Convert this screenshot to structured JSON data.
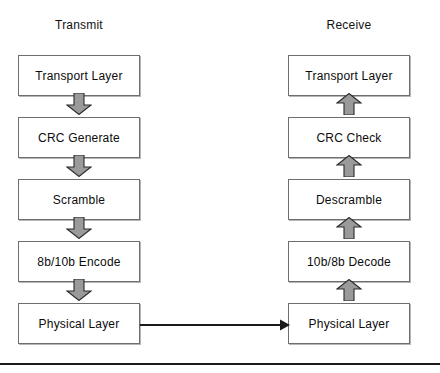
{
  "diagram": {
    "title_left": "Transmit",
    "title_right": "Receive",
    "colors": {
      "box_border": "#6e6e6e",
      "box_fill": "#ffffff",
      "arrow_fill": "#9a9a9a",
      "arrow_stroke": "#2b2b2b",
      "text": "#0c0c0c",
      "rule": "#1a1a1a"
    },
    "columns": [
      {
        "name": "transmit",
        "heading": "Transmit",
        "direction": "down",
        "boxes": [
          {
            "label": "Transport Layer"
          },
          {
            "label": "CRC Generate"
          },
          {
            "label": "Scramble"
          },
          {
            "label": "8b/10b Encode"
          },
          {
            "label": "Physical Layer"
          }
        ]
      },
      {
        "name": "receive",
        "heading": "Receive",
        "direction": "up",
        "boxes": [
          {
            "label": "Transport Layer"
          },
          {
            "label": "CRC Check"
          },
          {
            "label": "Descramble"
          },
          {
            "label": "10b/8b Decode"
          },
          {
            "label": "Physical Layer"
          }
        ]
      }
    ],
    "link": {
      "name": "physical-link",
      "from": "Physical Layer",
      "to": "Physical Layer",
      "direction": "left-to-right"
    }
  }
}
